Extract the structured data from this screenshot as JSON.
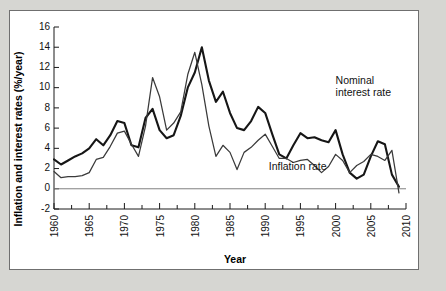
{
  "chart_data": {
    "type": "line",
    "title": "",
    "xlabel": "Year",
    "ylabel": "Inflation and interest rates (%/year)",
    "xlim": [
      1960,
      2010
    ],
    "ylim": [
      -2,
      16
    ],
    "grid": false,
    "legend_position": "inline-annotations",
    "x_major_ticks": [
      1960,
      1965,
      1970,
      1975,
      1980,
      1985,
      1990,
      1995,
      2000,
      2005,
      2010
    ],
    "x_minor_tick_step": 2.5,
    "y_ticks": [
      -2,
      0,
      2,
      4,
      6,
      8,
      10,
      12,
      14,
      16
    ],
    "x_tick_labels": [
      "1960",
      "1965",
      "1970",
      "1975",
      "1980",
      "1985",
      "1990",
      "1995",
      "2000",
      "2005",
      "2010"
    ],
    "y_tick_labels": [
      "-2",
      "0",
      "2",
      "4",
      "6",
      "8",
      "10",
      "12",
      "14",
      "16"
    ],
    "x": [
      1960,
      1961,
      1962,
      1963,
      1964,
      1965,
      1966,
      1967,
      1968,
      1969,
      1970,
      1971,
      1972,
      1973,
      1974,
      1975,
      1976,
      1977,
      1978,
      1979,
      1980,
      1981,
      1982,
      1983,
      1984,
      1985,
      1986,
      1987,
      1988,
      1989,
      1990,
      1991,
      1992,
      1993,
      1994,
      1995,
      1996,
      1997,
      1998,
      1999,
      2000,
      2001,
      2002,
      2003,
      2004,
      2005,
      2006,
      2007,
      2008,
      2009
    ],
    "series": [
      {
        "name": "Nominal interest rate",
        "color": "#161616",
        "line_width": 2.1,
        "annotation": "Nominal\ninterest rate",
        "values": [
          2.9,
          2.4,
          2.8,
          3.2,
          3.5,
          4.0,
          4.9,
          4.3,
          5.3,
          6.7,
          6.5,
          4.3,
          4.1,
          7.0,
          7.9,
          5.8,
          5.0,
          5.3,
          7.2,
          10.0,
          11.5,
          14.0,
          10.7,
          8.6,
          9.6,
          7.5,
          6.0,
          5.8,
          6.7,
          8.1,
          7.5,
          5.4,
          3.4,
          3.0,
          4.3,
          5.5,
          5.0,
          5.1,
          4.8,
          4.6,
          5.8,
          3.4,
          1.6,
          1.0,
          1.4,
          3.2,
          4.7,
          4.4,
          1.4,
          0.2
        ]
      },
      {
        "name": "Inflation rate",
        "color": "#3a3a3a",
        "line_width": 1.25,
        "annotation": "Inflation rate",
        "values": [
          1.7,
          1.1,
          1.2,
          1.2,
          1.3,
          1.6,
          2.9,
          3.1,
          4.2,
          5.5,
          5.7,
          4.4,
          3.2,
          6.2,
          11.0,
          9.1,
          5.8,
          6.5,
          7.6,
          11.3,
          13.5,
          10.3,
          6.2,
          3.2,
          4.3,
          3.6,
          1.9,
          3.6,
          4.1,
          4.8,
          5.4,
          4.2,
          3.0,
          3.0,
          2.6,
          2.8,
          2.9,
          2.3,
          1.6,
          2.2,
          3.4,
          2.8,
          1.6,
          2.3,
          2.7,
          3.4,
          3.2,
          2.8,
          3.8,
          -0.4
        ]
      }
    ],
    "annotations": [
      {
        "text_line_1": "Nominal",
        "text_line_2": "interest rate",
        "x": 2000.0,
        "y": 10.4
      },
      {
        "text_line_1": "Inflation rate",
        "text_line_2": "",
        "x": 1990.5,
        "y": 1.9
      }
    ]
  },
  "figure": {
    "background_color": "#ffffff",
    "outer_background_color": "#d6d6d2",
    "border_color": "#6f6f6f"
  }
}
